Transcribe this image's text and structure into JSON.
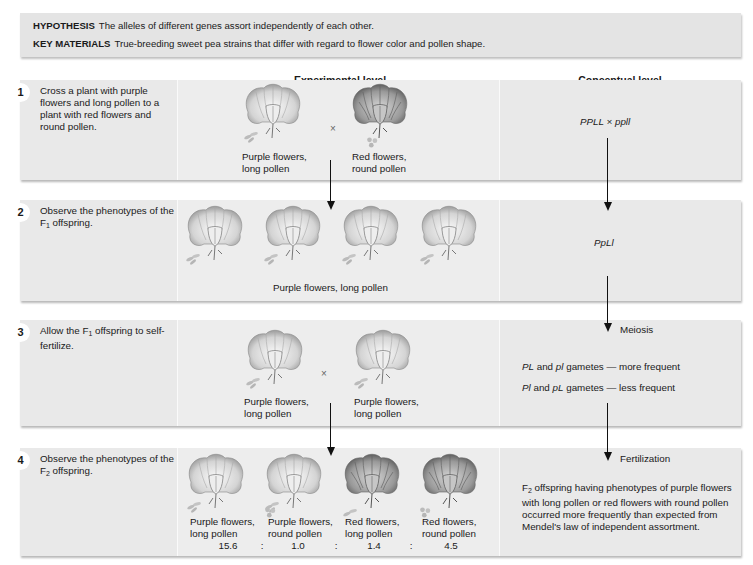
{
  "hypothesis": {
    "label": "HYPOTHESIS",
    "text": "The alleles of different genes assort independently of each other."
  },
  "key_materials": {
    "label": "KEY MATERIALS",
    "text": "True-breeding sweet pea strains that differ with regard to flower color and pollen shape."
  },
  "columns": {
    "experimental": "Experimental level",
    "conceptual": "Conceptual level"
  },
  "steps": [
    {
      "num": "1",
      "text": "Cross a plant with purple flowers and long pollen to a plant with red flowers and round pollen.",
      "cross_symbol": "×",
      "flowers": [
        {
          "color": "purple",
          "pollen": "long",
          "label1": "Purple flowers,",
          "label2": "long pollen"
        },
        {
          "color": "red",
          "pollen": "round",
          "label1": "Red flowers,",
          "label2": "round pollen"
        }
      ],
      "concept": "PPLL × ppll"
    },
    {
      "num": "2",
      "text_pre": "Observe the phenotypes of the F",
      "text_sub": "1",
      "text_post": " offspring.",
      "flowers_label": "Purple flowers, long pollen",
      "concept": "PpLl"
    },
    {
      "num": "3",
      "text_pre": "Allow the F",
      "text_sub": "1",
      "text_post": " offspring to self-fertilize.",
      "cross_symbol": "×",
      "flowers": [
        {
          "color": "purple",
          "pollen": "long",
          "label1": "Purple flowers,",
          "label2": "long pollen"
        },
        {
          "color": "purple",
          "pollen": "long",
          "label1": "Purple flowers,",
          "label2": "long pollen"
        }
      ],
      "arrow_label": "Meiosis",
      "gametes": [
        {
          "a": "PL",
          "b": "pl",
          "rest": "gametes — more frequent"
        },
        {
          "a": "Pl",
          "b": "pL",
          "rest": "gametes — less frequent"
        }
      ],
      "and": "and"
    },
    {
      "num": "4",
      "text_pre": "Observe the phenotypes of the F",
      "text_sub": "2",
      "text_post": " offspring.",
      "flowers": [
        {
          "color": "purple",
          "pollen": "long",
          "label1": "Purple flowers,",
          "label2": "long pollen",
          "ratio": "15.6"
        },
        {
          "color": "purple",
          "pollen": "round",
          "label1": "Purple flowers,",
          "label2": "round pollen",
          "ratio": "1.0"
        },
        {
          "color": "red",
          "pollen": "long",
          "label1": "Red flowers,",
          "label2": "long pollen",
          "ratio": "1.4"
        },
        {
          "color": "red",
          "pollen": "round",
          "label1": "Red flowers,",
          "label2": "round pollen",
          "ratio": "4.5"
        }
      ],
      "ratio_sep": ":",
      "arrow_label": "Fertilization",
      "conclusion_pre": "F",
      "conclusion_sub": "2",
      "conclusion_text": " offspring having phenotypes of purple flowers with long pollen or red flowers with round pollen occurred more frequently than expected from Mendel's law of independent assortment."
    }
  ],
  "colors": {
    "panel": "#e9e9e9",
    "header_box": "#e4e4e4",
    "arrow": "#111111"
  }
}
